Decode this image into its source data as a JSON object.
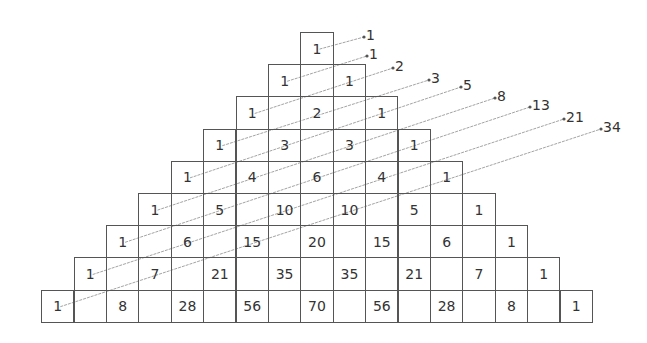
{
  "rows": [
    [
      1
    ],
    [
      1,
      1
    ],
    [
      1,
      2,
      1
    ],
    [
      1,
      3,
      3,
      1
    ],
    [
      1,
      4,
      6,
      4,
      1
    ],
    [
      1,
      5,
      10,
      10,
      5,
      1
    ],
    [
      1,
      6,
      15,
      20,
      15,
      6,
      1
    ],
    [
      1,
      7,
      21,
      35,
      35,
      21,
      7,
      1
    ],
    [
      1,
      8,
      28,
      56,
      70,
      56,
      28,
      8,
      1
    ]
  ],
  "diagonal_sums": [
    "1",
    "1",
    "2",
    "3",
    "5",
    "8",
    "13",
    "21",
    "34"
  ],
  "colors": {
    "line": "#999999",
    "border": "#555555",
    "text": "#333333"
  }
}
